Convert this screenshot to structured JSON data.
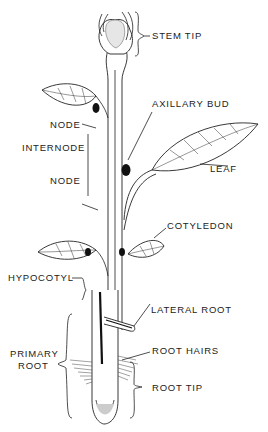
{
  "diagram": {
    "type": "labeled plant anatomy",
    "labels": {
      "stem_tip": "STEM TIP",
      "axillary_bud": "AXILLARY BUD",
      "node_upper": "NODE",
      "internode": "INTERNODE",
      "node_lower": "NODE",
      "leaf": "LEAF",
      "cotyledon": "COTYLEDON",
      "hypocotyl": "HYPOCOTYL",
      "lateral_root": "LATERAL ROOT",
      "primary_root_line1": "PRIMARY",
      "primary_root_line2": "ROOT",
      "root_hairs": "ROOT HAIRS",
      "root_tip": "ROOT TIP"
    }
  }
}
